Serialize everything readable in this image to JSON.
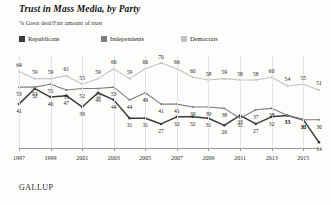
{
  "header": {
    "title": "Trust in Mass Media, by Party",
    "subtitle": "% Great deal/Fair amount of trust"
  },
  "source": "GALLUP",
  "colors": {
    "republicans": "#3b3b3b",
    "independents": "#7d7d7d",
    "democrats": "#c2c2c2",
    "grid": "#e3e3e0",
    "axis": "#9a9a96"
  },
  "chart_data": {
    "type": "line",
    "title": "Trust in Mass Media, by Party",
    "subtitle": "% Great deal/Fair amount of trust",
    "xlabel": "",
    "ylabel": "% Great deal/Fair amount of trust",
    "ylim": [
      10,
      75
    ],
    "grid": true,
    "legend_position": "top-left",
    "x": [
      1997,
      1998,
      1999,
      2000,
      2001,
      2002,
      2003,
      2004,
      2005,
      2006,
      2007,
      2008,
      2009,
      2010,
      2011,
      2012,
      2013,
      2014,
      2015,
      2016
    ],
    "xticks": [
      1997,
      1999,
      2001,
      2003,
      2005,
      2007,
      2009,
      2011,
      2013,
      2015
    ],
    "series": [
      {
        "name": "Republicans",
        "color": "#3b3b3b",
        "values": [
          41,
          52,
          46,
          47,
          39,
          49,
          44,
          31,
          31,
          27,
          32,
          32,
          31,
          26,
          33,
          27,
          32,
          33,
          30,
          14
        ]
      },
      {
        "name": "Independents",
        "color": "#7d7d7d",
        "values": [
          53,
          53,
          55,
          51,
          52,
          52,
          53,
          44,
          49,
          41,
          41,
          39,
          39,
          38,
          31,
          37,
          38,
          33,
          30,
          30
        ]
      },
      {
        "name": "Democrats",
        "color": "#c2c2c2",
        "values": [
          64,
          59,
          59,
          61,
          55,
          59,
          66,
          59,
          66,
          70,
          66,
          60,
          58,
          59,
          58,
          58,
          60,
          54,
          55,
          51
        ]
      }
    ]
  }
}
